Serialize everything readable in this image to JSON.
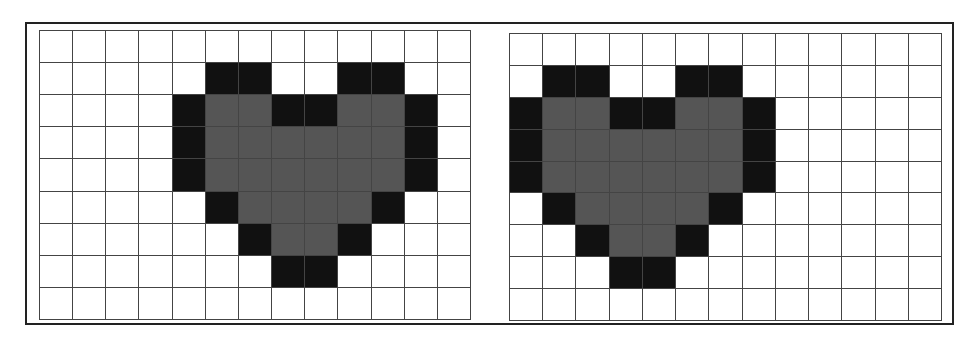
{
  "figure": {
    "colors": {
      "empty": "#ffffff",
      "outline": "#111111",
      "fill": "#555555",
      "gridline": "#444444",
      "frame": "#222222"
    },
    "legend": {
      "0": "empty",
      "1": "outline (black)",
      "2": "fill (gray)"
    }
  },
  "grids": [
    {
      "name": "left-grid",
      "rows": 9,
      "cols": 13,
      "cells": [
        [
          0,
          0,
          0,
          0,
          0,
          0,
          0,
          0,
          0,
          0,
          0,
          0,
          0
        ],
        [
          0,
          0,
          0,
          0,
          0,
          1,
          1,
          0,
          0,
          1,
          1,
          0,
          0
        ],
        [
          0,
          0,
          0,
          0,
          1,
          2,
          2,
          1,
          1,
          2,
          2,
          1,
          0
        ],
        [
          0,
          0,
          0,
          0,
          1,
          2,
          2,
          2,
          2,
          2,
          2,
          1,
          0
        ],
        [
          0,
          0,
          0,
          0,
          1,
          2,
          2,
          2,
          2,
          2,
          2,
          1,
          0
        ],
        [
          0,
          0,
          0,
          0,
          0,
          1,
          2,
          2,
          2,
          2,
          1,
          0,
          0
        ],
        [
          0,
          0,
          0,
          0,
          0,
          0,
          1,
          2,
          2,
          1,
          0,
          0,
          0
        ],
        [
          0,
          0,
          0,
          0,
          0,
          0,
          0,
          1,
          1,
          0,
          0,
          0,
          0
        ],
        [
          0,
          0,
          0,
          0,
          0,
          0,
          0,
          0,
          0,
          0,
          0,
          0,
          0
        ]
      ]
    },
    {
      "name": "right-grid",
      "rows": 9,
      "cols": 13,
      "cells": [
        [
          0,
          0,
          0,
          0,
          0,
          0,
          0,
          0,
          0,
          0,
          0,
          0,
          0
        ],
        [
          0,
          1,
          1,
          0,
          0,
          1,
          1,
          0,
          0,
          0,
          0,
          0,
          0
        ],
        [
          1,
          2,
          2,
          1,
          1,
          2,
          2,
          1,
          0,
          0,
          0,
          0,
          0
        ],
        [
          1,
          2,
          2,
          2,
          2,
          2,
          2,
          1,
          0,
          0,
          0,
          0,
          0
        ],
        [
          1,
          2,
          2,
          2,
          2,
          2,
          2,
          1,
          0,
          0,
          0,
          0,
          0
        ],
        [
          0,
          1,
          2,
          2,
          2,
          2,
          1,
          0,
          0,
          0,
          0,
          0,
          0
        ],
        [
          0,
          0,
          1,
          2,
          2,
          1,
          0,
          0,
          0,
          0,
          0,
          0,
          0
        ],
        [
          0,
          0,
          0,
          1,
          1,
          0,
          0,
          0,
          0,
          0,
          0,
          0,
          0
        ],
        [
          0,
          0,
          0,
          0,
          0,
          0,
          0,
          0,
          0,
          0,
          0,
          0,
          0
        ]
      ]
    }
  ]
}
